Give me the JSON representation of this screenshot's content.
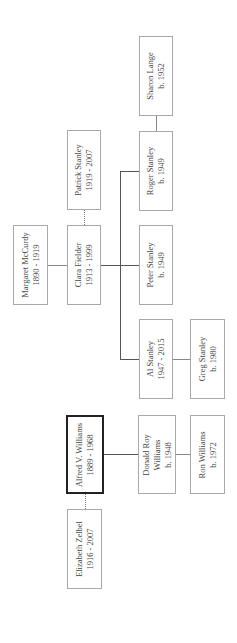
{
  "diagram": {
    "type": "family-tree",
    "orientation": "rotated-90-ccw",
    "people": [
      {
        "id": "sharon",
        "name": "Sharon Lange",
        "dates": "b. 1952",
        "box": [
          139,
          36,
          34,
          80
        ]
      },
      {
        "id": "patrick",
        "name": "Patrick Stanley",
        "dates": "1919 - 2007",
        "box": [
          67,
          130,
          34,
          80
        ]
      },
      {
        "id": "roger",
        "name": "Roger Stanley",
        "dates": "b. 1949",
        "box": [
          139,
          131,
          34,
          80
        ]
      },
      {
        "id": "margaret",
        "name": "Margaret McCurdy",
        "dates": "1890 - 1919",
        "box": [
          13,
          225,
          35,
          80
        ]
      },
      {
        "id": "clara",
        "name": "Clara Fielder",
        "dates": "1913 - 1999",
        "box": [
          67,
          225,
          34,
          80
        ]
      },
      {
        "id": "peter",
        "name": "Peter Stanley",
        "dates": "b. 1949",
        "box": [
          139,
          225,
          34,
          80
        ]
      },
      {
        "id": "al",
        "name": "Al Stanley",
        "dates": "1947 - 2015",
        "box": [
          139,
          319,
          34,
          80
        ]
      },
      {
        "id": "greg",
        "name": "Greg Stanley",
        "dates": "b. 1980",
        "box": [
          190,
          319,
          35,
          80
        ]
      },
      {
        "id": "alfred",
        "name": "Alfred V. Williams",
        "dates": "1889 - 1968",
        "box": [
          66,
          415,
          38,
          79
        ],
        "focus": true
      },
      {
        "id": "donald",
        "name": "Donald Roy Williams",
        "name_lines": [
          "Donald Roy",
          "Williams"
        ],
        "dates": "b. 1948",
        "box": [
          138,
          415,
          38,
          79
        ]
      },
      {
        "id": "ron",
        "name": "Ron Williams",
        "dates": "b. 1972",
        "box": [
          190,
          415,
          35,
          79
        ]
      },
      {
        "id": "elizabeth",
        "name": "Elizabeth Zelbel",
        "dates": "1916 - 2007",
        "box": [
          67,
          509,
          35,
          80
        ]
      }
    ],
    "relations": [
      {
        "type": "spouse",
        "a": "sharon",
        "b": "roger"
      },
      {
        "type": "spouse",
        "a": "patrick",
        "b": "clara"
      },
      {
        "type": "parent-child",
        "parent": "margaret",
        "child": "clara"
      },
      {
        "type": "parent-child",
        "parent": "clara",
        "child": "roger"
      },
      {
        "type": "parent-child",
        "parent": "clara",
        "child": "peter"
      },
      {
        "type": "parent-child",
        "parent": "clara",
        "child": "al"
      },
      {
        "type": "parent-child",
        "parent": "al",
        "child": "greg"
      },
      {
        "type": "parent-child",
        "parent": "alfred",
        "child": "donald"
      },
      {
        "type": "parent-child",
        "parent": "donald",
        "child": "ron"
      },
      {
        "type": "spouse",
        "a": "alfred",
        "b": "elizabeth"
      }
    ]
  }
}
